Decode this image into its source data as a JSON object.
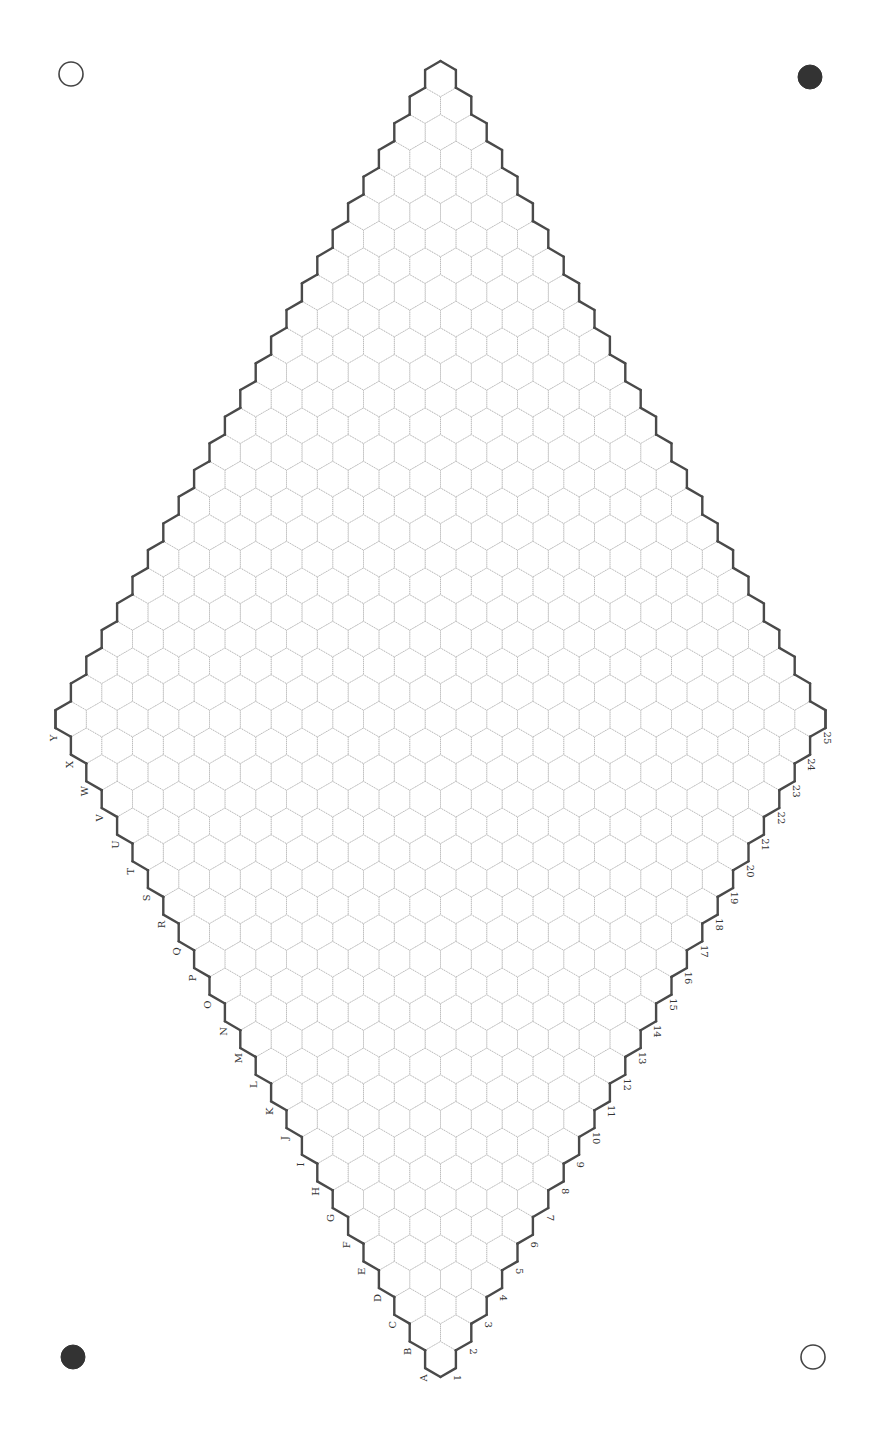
{
  "board": {
    "type": "hex-board",
    "size": 25,
    "row_labels": [
      "A",
      "B",
      "C",
      "D",
      "E",
      "F",
      "G",
      "H",
      "I",
      "J",
      "K",
      "L",
      "M",
      "N",
      "O",
      "P",
      "Q",
      "R",
      "S",
      "T",
      "U",
      "V",
      "W",
      "X",
      "Y"
    ],
    "column_labels": [
      "1",
      "2",
      "3",
      "4",
      "5",
      "6",
      "7",
      "8",
      "9",
      "10",
      "11",
      "12",
      "13",
      "14",
      "15",
      "16",
      "17",
      "18",
      "19",
      "20",
      "21",
      "22",
      "23",
      "24",
      "25"
    ],
    "geometry": {
      "bottom_cell_center_x": 440.5,
      "bottom_cell_center_y": 1359.2,
      "hex_width": 30.8
    },
    "colors": {
      "grid_line": "#b8b8b8",
      "border_line": "#4a4a4a",
      "label": "#333333",
      "background": "#ffffff"
    },
    "stones": []
  },
  "corner_markers": [
    {
      "position": "top-left",
      "style": "open",
      "x": 71,
      "y": 74,
      "r": 12
    },
    {
      "position": "top-right",
      "style": "filled",
      "x": 810,
      "y": 77,
      "r": 12
    },
    {
      "position": "bottom-left",
      "style": "filled",
      "x": 73,
      "y": 1357,
      "r": 12
    },
    {
      "position": "bottom-right",
      "style": "open",
      "x": 813,
      "y": 1357,
      "r": 12
    }
  ]
}
